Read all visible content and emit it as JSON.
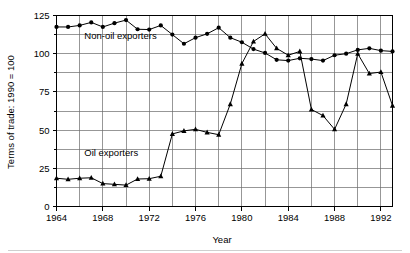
{
  "chart_data": {
    "type": "line",
    "title": "",
    "subtitle": "",
    "xlabel": "Year",
    "ylabel": "Terms of trade: 1990 = 100",
    "xlim": [
      1964,
      1993
    ],
    "ylim": [
      0,
      125
    ],
    "yticks": [
      0,
      25,
      50,
      75,
      100,
      125
    ],
    "ytick_labels": [
      "0",
      "25",
      "50",
      "75",
      "100",
      "125"
    ],
    "y_minor_step": 12.5,
    "xticks": [
      1964,
      1968,
      1972,
      1976,
      1980,
      1984,
      1988,
      1992
    ],
    "xtick_labels": [
      "1964",
      "1968",
      "1972",
      "1976",
      "1980",
      "1984",
      "1988",
      "1992"
    ],
    "x_grid_step": 2,
    "grid": true,
    "legend_position": "inline-annotations",
    "annotations": [
      {
        "text": "Non-oil exporters",
        "x": 1966.4,
        "y": 109.5,
        "name": "non-oil-exporters-annotation"
      },
      {
        "text": "Oil exporters",
        "x": 1966.4,
        "y": 33.0,
        "name": "oil-exporters-annotation"
      }
    ],
    "x": [
      1964,
      1965,
      1966,
      1967,
      1968,
      1969,
      1970,
      1971,
      1972,
      1973,
      1974,
      1975,
      1976,
      1977,
      1978,
      1979,
      1980,
      1981,
      1982,
      1983,
      1984,
      1985,
      1986,
      1987,
      1988,
      1989,
      1990,
      1991,
      1992,
      1993
    ],
    "series": [
      {
        "name": "Non-oil exporters",
        "marker": "circle",
        "color": "#000000",
        "values": [
          117.5,
          117.5,
          118.5,
          120.5,
          117.5,
          120.0,
          122.0,
          116.0,
          115.8,
          118.5,
          112.5,
          106.5,
          110.5,
          113.0,
          117.0,
          110.5,
          107.5,
          103.0,
          100.5,
          96.0,
          95.5,
          97.0,
          96.5,
          95.5,
          99.0,
          100.0,
          102.5,
          103.5,
          102.0,
          101.5
        ]
      },
      {
        "name": "Oil exporters",
        "marker": "triangle",
        "color": "#000000",
        "values": [
          18.5,
          17.8,
          18.5,
          18.8,
          15.0,
          14.5,
          14.0,
          18.0,
          18.2,
          19.8,
          47.5,
          49.5,
          50.5,
          48.5,
          47.0,
          67.0,
          93.5,
          108.0,
          113.0,
          103.5,
          99.0,
          101.5,
          63.5,
          59.5,
          50.5,
          67.0,
          100.0,
          87.0,
          88.0,
          66.0
        ]
      }
    ]
  },
  "axis": {
    "ylabel_text": "Terms of trade: 1990 = 100",
    "xlabel_text": "Year"
  }
}
